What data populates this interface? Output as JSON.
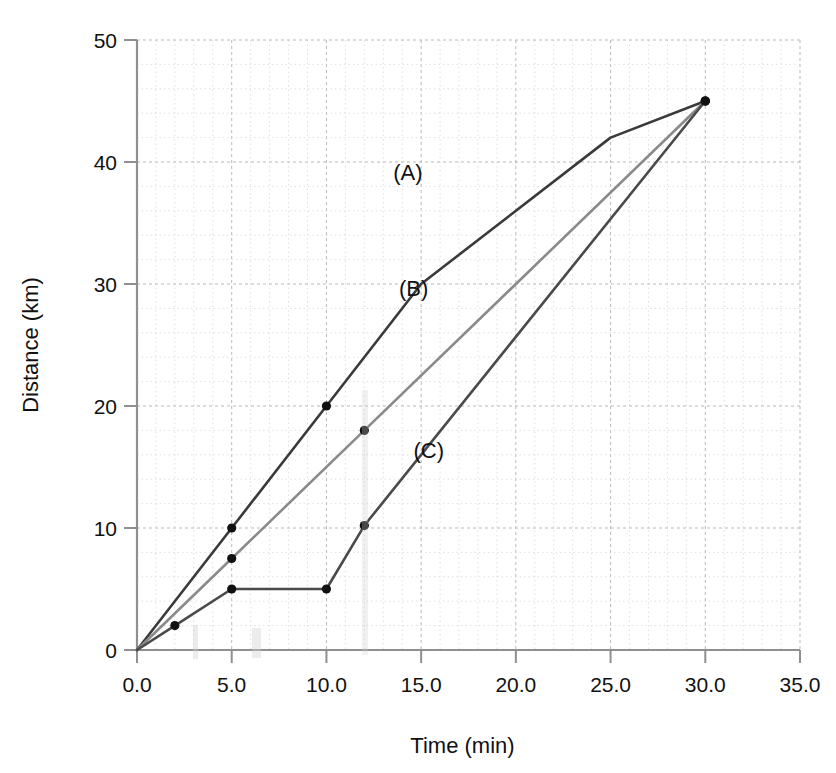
{
  "chart_data": {
    "type": "line",
    "title": "",
    "xlabel": "Time (min)",
    "ylabel": "Distance (km)",
    "xlim": [
      0,
      35
    ],
    "ylim": [
      0,
      50
    ],
    "x_ticks": [
      "0.0",
      "5.0",
      "10.0",
      "15.0",
      "20.0",
      "25.0",
      "30.0",
      "35.0"
    ],
    "x_tick_values": [
      0,
      5,
      10,
      15,
      20,
      25,
      30,
      35
    ],
    "y_ticks": [
      "0",
      "10",
      "20",
      "30",
      "40",
      "50"
    ],
    "y_tick_values": [
      0,
      10,
      20,
      30,
      40,
      50
    ],
    "x_minor_step": 1,
    "y_minor_step": 2,
    "grid": "dashed-minor-and-major",
    "legend": "inline-annotations",
    "series": [
      {
        "name": "(A)",
        "color": "#3a3a3a",
        "label_x": 14.3,
        "label_y": 38.5,
        "points": [
          {
            "x": 0,
            "y": 0
          },
          {
            "x": 5,
            "y": 10
          },
          {
            "x": 10,
            "y": 20
          },
          {
            "x": 15,
            "y": 30
          },
          {
            "x": 25,
            "y": 42
          },
          {
            "x": 30,
            "y": 45
          }
        ],
        "markers": [
          {
            "x": 5,
            "y": 10
          },
          {
            "x": 10,
            "y": 20
          },
          {
            "x": 30,
            "y": 45
          }
        ]
      },
      {
        "name": "(B)",
        "color": "#8a8a8a",
        "label_x": 14.6,
        "label_y": 29.0,
        "points": [
          {
            "x": 0,
            "y": 0
          },
          {
            "x": 5,
            "y": 7.5
          },
          {
            "x": 12,
            "y": 18
          },
          {
            "x": 30,
            "y": 45
          }
        ],
        "markers": [
          {
            "x": 5,
            "y": 7.5
          },
          {
            "x": 12,
            "y": 18
          },
          {
            "x": 30,
            "y": 45
          }
        ]
      },
      {
        "name": "(C)",
        "color": "#4a4a4a",
        "label_x": 15.4,
        "label_y": 15.7,
        "points": [
          {
            "x": 0,
            "y": 0
          },
          {
            "x": 2,
            "y": 2
          },
          {
            "x": 5,
            "y": 5
          },
          {
            "x": 10,
            "y": 5
          },
          {
            "x": 12,
            "y": 10.2
          },
          {
            "x": 30,
            "y": 45
          }
        ],
        "markers": [
          {
            "x": 2,
            "y": 2
          },
          {
            "x": 5,
            "y": 5
          },
          {
            "x": 10,
            "y": 5
          },
          {
            "x": 12,
            "y": 10.2
          },
          {
            "x": 30,
            "y": 45
          }
        ]
      }
    ],
    "annotations": [
      {
        "text": "(A)",
        "x": 14.3,
        "y": 38.5
      },
      {
        "text": "(B)",
        "x": 14.6,
        "y": 29.0
      },
      {
        "text": "(C)",
        "x": 15.4,
        "y": 15.7
      }
    ]
  }
}
